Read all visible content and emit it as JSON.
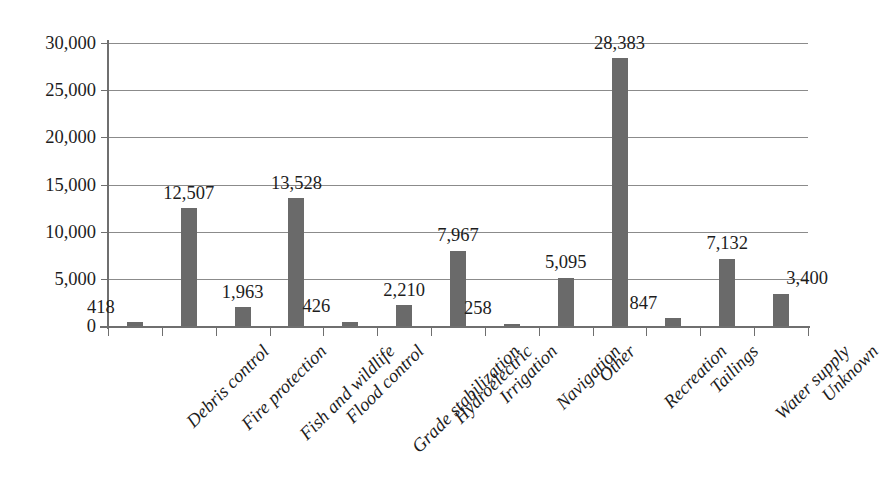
{
  "chart_data": {
    "type": "bar",
    "title": "",
    "subtitle": "",
    "xlabel": "",
    "ylabel": "",
    "ylim": [
      0,
      30000
    ],
    "ytick_values": [
      0,
      5000,
      10000,
      15000,
      20000,
      25000,
      30000
    ],
    "ytick_labels": [
      "0",
      "5,000",
      "10,000",
      "15,000",
      "20,000",
      "25,000",
      "30,000"
    ],
    "grid": true,
    "grid_axis": "y",
    "legend": false,
    "legend_position": "none",
    "bar_color": "#6a6a6a",
    "gridline_color": "#8b8b8b",
    "axis_color": "#6f6f6f",
    "background_color": "#ffffff",
    "categories": [
      "Debris control",
      "Fire protection",
      "Fish and wildlife",
      "Flood control",
      "Grade stabilization",
      "Hydroelectric",
      "Irrigation",
      "Navigation",
      "Other",
      "Recreation",
      "Tailings",
      "Water supply",
      "Unknown"
    ],
    "values": [
      418,
      12507,
      1963,
      13528,
      426,
      2210,
      7967,
      258,
      5095,
      28383,
      847,
      7132,
      3400
    ],
    "value_labels": [
      "418",
      "12,507",
      "1,963",
      "13,528",
      "426",
      "2,210",
      "7,967",
      "258",
      "5,095",
      "28,383",
      "847",
      "7,132",
      "3,400"
    ],
    "label_offsets_px": [
      -34,
      0,
      0,
      0,
      -34,
      0,
      0,
      -34,
      0,
      0,
      -30,
      0,
      26
    ]
  }
}
